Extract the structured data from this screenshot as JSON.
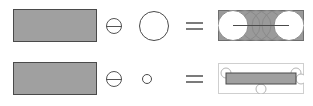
{
  "figure": {
    "background": "#ffffff",
    "width": 313,
    "height": 106,
    "colors": {
      "shape_fill": "#a0a0a0",
      "shape_stroke": "#4a4a4a",
      "panel_fill_dark": "#9a9a9a",
      "panel_stroke_dark": "#6e6e6e",
      "panel_fill_light": "#ffffff",
      "panel_stroke_light": "#cfcfcf",
      "trace_stroke": "#8a8a8a",
      "disk_fill": "#ffffff",
      "operator_stroke": "#555555",
      "equals_stroke": "#7b7b7b"
    }
  },
  "rows": [
    {
      "id": "row-0",
      "label": "erosion-large-disk",
      "operand_a": {
        "name": "gray-rectangle",
        "shape": "rectangle",
        "x": 13,
        "y": 9,
        "width": 84,
        "height": 33
      },
      "operator": {
        "name": "minus-in-circle",
        "glyph": "circled-minus",
        "x": 106,
        "y": 18,
        "size": 16
      },
      "operand_b": {
        "name": "large-circle",
        "shape": "circle",
        "cx": 154,
        "cy": 26,
        "r": 15
      },
      "equals": {
        "name": "equals-sign",
        "x": 186,
        "y": 22,
        "width": 17,
        "height": 8
      },
      "result": {
        "name": "result-panel-dark",
        "x": 218,
        "y": 10,
        "width": 86,
        "height": 31,
        "panel_style": "dark",
        "disk_radius": 15,
        "disks_filled": [
          {
            "cx": 15,
            "cy": 15.5
          },
          {
            "cx": 71,
            "cy": 15.5
          }
        ],
        "disks_outline": [
          {
            "cx": 27,
            "cy": 15.5
          },
          {
            "cx": 38,
            "cy": 15.5
          },
          {
            "cx": 49,
            "cy": 15.5
          },
          {
            "cx": 59,
            "cy": 15.5
          }
        ],
        "center_line": {
          "x1": 15,
          "x2": 71,
          "y": 15.5
        }
      }
    },
    {
      "id": "row-1",
      "label": "erosion-small-disk",
      "operand_a": {
        "name": "gray-rectangle",
        "shape": "rectangle",
        "x": 13,
        "y": 62,
        "width": 84,
        "height": 33
      },
      "operator": {
        "name": "minus-in-circle",
        "glyph": "circled-minus",
        "x": 106,
        "y": 71,
        "size": 16
      },
      "operand_b": {
        "name": "small-circle",
        "shape": "circle",
        "cx": 147,
        "cy": 79,
        "r": 5
      },
      "equals": {
        "name": "equals-sign",
        "x": 186,
        "y": 75,
        "width": 17,
        "height": 8
      },
      "result": {
        "name": "result-panel-light",
        "x": 218,
        "y": 63,
        "width": 86,
        "height": 31,
        "panel_style": "light",
        "eroded_bar": {
          "x": 8,
          "y": 10,
          "width": 70,
          "height": 11
        },
        "disk_radius": 5,
        "disks_outline": [
          {
            "cx": 8,
            "cy": 10
          },
          {
            "cx": 78,
            "cy": 10
          },
          {
            "cx": 83,
            "cy": 16
          },
          {
            "cx": 43,
            "cy": 26
          }
        ]
      }
    }
  ]
}
